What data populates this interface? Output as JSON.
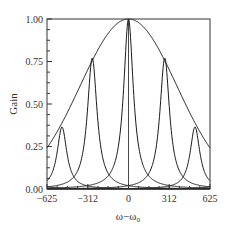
{
  "chart_data": {
    "type": "line",
    "title": "",
    "xlabel": "ω−ω₀",
    "ylabel": "Gain",
    "xlim": [
      -625,
      625
    ],
    "ylim": [
      0,
      1.0
    ],
    "x_ticks": [
      -625,
      -312,
      0,
      312,
      625
    ],
    "x_tick_labels": [
      "−625",
      "−312",
      "0",
      "312",
      "625"
    ],
    "y_ticks": [
      0.0,
      0.25,
      0.5,
      0.75,
      1.0
    ],
    "y_tick_labels": [
      "0.00",
      "0.25",
      "0.50",
      "0.75",
      "1.00"
    ],
    "y_minor_ticks_per_major": 4,
    "grid": false,
    "legend": null,
    "series": [
      {
        "name": "envelope",
        "kind": "gaussian",
        "center": 0,
        "peak": 1.0,
        "sigma": 371
      },
      {
        "name": "resonance-0",
        "kind": "lorentzian",
        "center": 0,
        "peak": 1.0,
        "hwhm": 45
      },
      {
        "name": "resonance-+278",
        "kind": "lorentzian",
        "center": 278,
        "peak": 0.77,
        "hwhm": 45
      },
      {
        "name": "resonance--278",
        "kind": "lorentzian",
        "center": -278,
        "peak": 0.77,
        "hwhm": 45
      },
      {
        "name": "resonance-+510",
        "kind": "lorentzian",
        "center": 510,
        "peak": 0.365,
        "hwhm": 45
      },
      {
        "name": "resonance--510",
        "kind": "lorentzian",
        "center": -510,
        "peak": 0.365,
        "hwhm": 45
      },
      {
        "name": "resonance-+750",
        "kind": "lorentzian",
        "center": 750,
        "peak": 0.13,
        "hwhm": 45
      },
      {
        "name": "resonance--750",
        "kind": "lorentzian",
        "center": -750,
        "peak": 0.13,
        "hwhm": 45
      }
    ],
    "peak_summary": {
      "centers": [
        -510,
        -278,
        0,
        278,
        510
      ],
      "heights": [
        0.365,
        0.77,
        1.0,
        0.77,
        0.365
      ]
    }
  },
  "axes": {
    "xlabel": "ω−ω₀",
    "ylabel": "Gain"
  },
  "colors": {
    "line": "#1a1a1a",
    "frame": "#333333",
    "text": "#333333",
    "background": "#ffffff"
  }
}
